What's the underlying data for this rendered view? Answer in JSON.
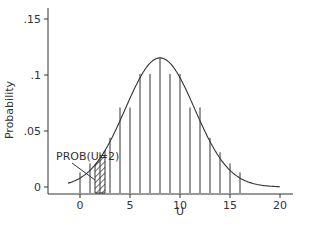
{
  "chart_data": {
    "type": "line",
    "title": "",
    "xlabel": "U",
    "ylabel": "Probability",
    "xlim": [
      -2.5,
      21
    ],
    "ylim": [
      0,
      0.155
    ],
    "x_ticks": [
      0,
      5,
      10,
      15,
      20
    ],
    "x_tick_labels": [
      "0",
      "5",
      "10",
      "15",
      "20"
    ],
    "y_ticks": [
      0,
      0.05,
      0.1,
      0.15
    ],
    "y_tick_labels": [
      "0",
      ".05",
      ".1",
      ".15"
    ],
    "grid": false,
    "legend": null,
    "series": [
      {
        "name": "normal density curve",
        "description": "Normal approximation curve, mean ≈ 8, sd ≈ 3.46",
        "mean": 8,
        "sd": 3.46
      },
      {
        "name": "discrete probability spikes",
        "x": [
          0,
          1,
          2,
          3,
          4,
          5,
          6,
          7,
          8,
          9,
          10,
          11,
          12,
          13,
          14,
          15,
          16
        ],
        "values": [
          0.013,
          0.021,
          0.031,
          0.044,
          0.071,
          0.071,
          0.101,
          0.101,
          0.115,
          0.101,
          0.101,
          0.071,
          0.071,
          0.044,
          0.031,
          0.021,
          0.013
        ]
      }
    ],
    "annotations": [
      {
        "text": "PROB(U=2)",
        "target_x": 2,
        "shaded_interval": [
          1.5,
          2.5
        ],
        "style": "hatched"
      }
    ]
  },
  "labels": {
    "annotation": "PROB(U=2)",
    "xlabel": "U",
    "ylabel": "Probability"
  }
}
